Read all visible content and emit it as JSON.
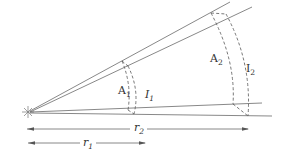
{
  "diagram": {
    "labels": {
      "area1": {
        "main": "A",
        "sub": "1"
      },
      "area2": {
        "main": "A",
        "sub": "2"
      },
      "intensity1": {
        "main": "I",
        "sub": "1"
      },
      "intensity2": {
        "main": "I",
        "sub": "2"
      },
      "distance1": {
        "main": "r",
        "sub": "1"
      },
      "distance2": {
        "main": "r",
        "sub": "2"
      }
    },
    "source_icon": "light-source-star-icon",
    "line_color": "#6a6a6a",
    "text_color": "#333333"
  }
}
